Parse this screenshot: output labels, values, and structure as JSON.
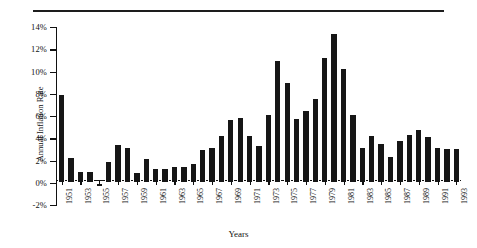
{
  "figure": {
    "top_rule": true,
    "axis_title_y": "Annual Inflation Rate",
    "axis_title_x": "Years"
  },
  "chart_data": {
    "type": "bar",
    "title": "",
    "xlabel": "Years",
    "ylabel": "Annual Inflation Rate",
    "ylim": [
      -2,
      14
    ],
    "ytick_labels": [
      "14%",
      "12%",
      "10%",
      "8%",
      "6%",
      "4%",
      "2%",
      "0%",
      "-2%"
    ],
    "ytick_values": [
      14,
      12,
      10,
      8,
      6,
      4,
      2,
      0,
      -2
    ],
    "grid": false,
    "legend": "none",
    "bar_color": "#161616",
    "xtick_label_interval": 2,
    "xtick_labels": [
      "1951",
      "1953",
      "1955",
      "1957",
      "1959",
      "1961",
      "1963",
      "1965",
      "1967",
      "1969",
      "1971",
      "1973",
      "1975",
      "1977",
      "1979",
      "1981",
      "1983",
      "1985",
      "1987",
      "1989",
      "1991",
      "1993"
    ],
    "categories": [
      "1951",
      "1952",
      "1953",
      "1954",
      "1955",
      "1956",
      "1957",
      "1958",
      "1959",
      "1960",
      "1961",
      "1962",
      "1963",
      "1964",
      "1965",
      "1966",
      "1967",
      "1968",
      "1969",
      "1970",
      "1971",
      "1972",
      "1973",
      "1974",
      "1975",
      "1976",
      "1977",
      "1978",
      "1979",
      "1980",
      "1981",
      "1982",
      "1983",
      "1984",
      "1985",
      "1986",
      "1987",
      "1988",
      "1989",
      "1990",
      "1991",
      "1992",
      "1993"
    ],
    "values": [
      8.0,
      2.3,
      1.1,
      1.1,
      -0.4,
      2.0,
      3.5,
      3.2,
      1.0,
      2.2,
      1.3,
      1.3,
      1.5,
      1.5,
      1.8,
      3.0,
      3.2,
      4.3,
      5.7,
      5.9,
      4.3,
      3.4,
      6.2,
      11.0,
      9.1,
      5.8,
      6.5,
      7.6,
      11.3,
      13.5,
      10.3,
      6.2,
      3.2,
      4.3,
      3.6,
      2.4,
      3.8,
      4.4,
      4.8,
      4.2,
      3.2,
      3.1,
      3.1
    ]
  }
}
